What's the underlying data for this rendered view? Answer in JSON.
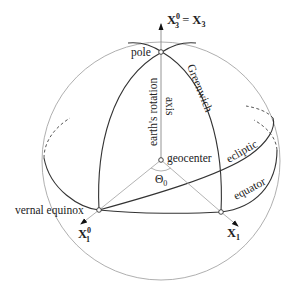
{
  "diagram": {
    "labels": {
      "axis_top_lhs": "X",
      "axis_top_lhs_sup": "0",
      "axis_top_lhs_sub": "3",
      "axis_top_eq": " = ",
      "axis_top_rhs": "X",
      "axis_top_rhs_sub": "3",
      "pole": "pole",
      "greenwich": "Greenwich",
      "rotation_axis_line1": "earth's rotation",
      "rotation_axis_line2": "axis",
      "geocenter": "geocenter",
      "theta": "Θ",
      "theta_sub": "0",
      "ecliptic": "ecliptic",
      "equator": "equator",
      "vernal_equinox": "vernal equinox",
      "x1_0": "X",
      "x1_0_sup": "0",
      "x1_0_sub": "1",
      "x1": "X",
      "x1_sub": "1"
    },
    "colors": {
      "sphere_outline": "#9a9a9a",
      "great_circles": "#333333",
      "rays": "#aaaaaa",
      "text": "#222222"
    }
  }
}
